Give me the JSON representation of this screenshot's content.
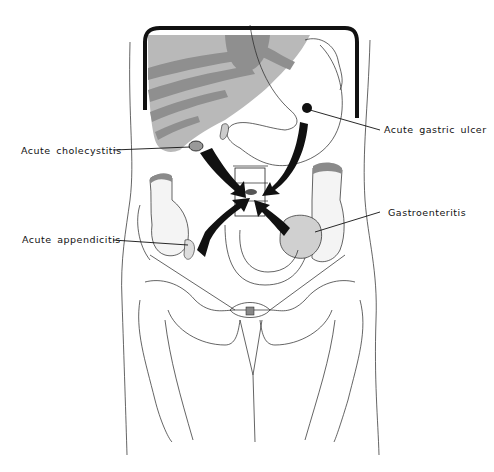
{
  "figure": {
    "colors": {
      "liver_fill": "#b9b9b9",
      "rib_bands": "#8f8f8f",
      "arrow": "#111111",
      "outline": "#222222"
    },
    "labels": [
      {
        "id": "gastric-ulcer",
        "text": "Acute gastric ulcer"
      },
      {
        "id": "cholecystitis",
        "text": "Acute cholecystitis"
      },
      {
        "id": "gastroenteritis",
        "text": "Gastroenteritis"
      },
      {
        "id": "appendicitis",
        "text": "Acute appendicitis"
      }
    ],
    "caption": ""
  }
}
